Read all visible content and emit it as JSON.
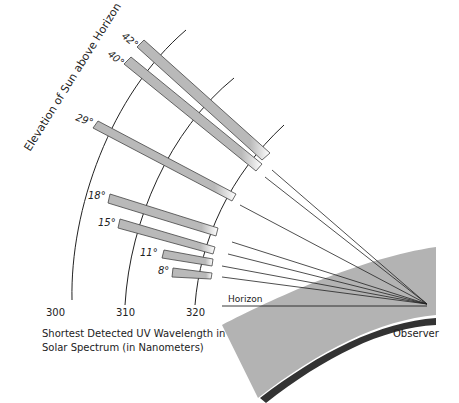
{
  "diagram": {
    "rotated_title": "Elevation of Sun above Horizon",
    "axis_caption_line1": "Shortest Detected UV Wavelength in",
    "axis_caption_line2": "Solar Spectrum (in Nanometers)",
    "horizon_label": "Horizon",
    "observer_label": "Observer",
    "wavelength_ticks": [
      "300",
      "310",
      "320"
    ],
    "elevations": [
      {
        "label": "42°"
      },
      {
        "label": "40°"
      },
      {
        "label": "29°"
      },
      {
        "label": "18°"
      },
      {
        "label": "15°"
      },
      {
        "label": "11°"
      },
      {
        "label": "8°"
      }
    ],
    "colors": {
      "bar_fill": "#b9b9b9",
      "bar_stroke": "#444444",
      "land": "#b3b3b3",
      "land_edge": "#333333",
      "line": "#222222"
    }
  }
}
